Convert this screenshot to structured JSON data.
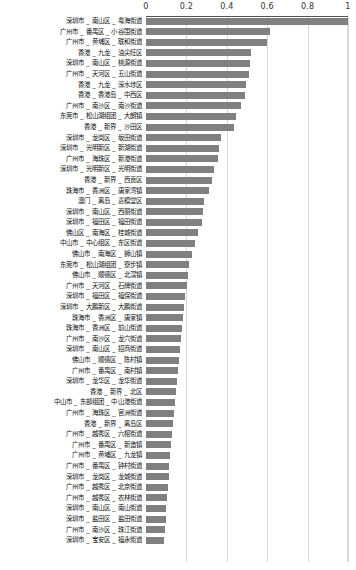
{
  "chart_data": {
    "type": "bar",
    "orientation": "horizontal",
    "title": "",
    "xlabel": "",
    "ylabel": "",
    "xlim": [
      0,
      1
    ],
    "grid": true,
    "legend": null,
    "bar_color": "#808080",
    "axis_color": "#555555",
    "grid_color": "#d8d8d8",
    "xticks": [
      0,
      0.2,
      0.4,
      0.6,
      0.8,
      1
    ],
    "xtick_labels": [
      "0",
      "0.2",
      "0.4",
      "0.6",
      "0.8",
      "1"
    ],
    "categories": [
      "深圳市 _ 南山区 _ 粤海街道",
      "广州市 _ 番禺区 _ 小谷围街道",
      "广州市 _ 黄埔区 _ 联和街道",
      "香港 _ 九龙 _ 油尖旺区",
      "深圳市 _ 南山区 _ 桃源街道",
      "广州市 _ 天河区 _ 五山街道",
      "香港 _ 九龙 _ 深水埗区",
      "香港 _ 香港岛 _ 中西区",
      "广州市 _ 南沙区 _ 南沙街道",
      "东莞市 _ 松山湖组团 _ 大朗镇",
      "香港 _ 新界 _ 沙田区",
      "深圳市 _ 龙岗区 _ 坂田街道",
      "深圳市 _ 光明新区 _ 新湖街道",
      "广州市 _ 海珠区 _ 新港街道",
      "深圳市 _ 光明新区 _ 光明街道",
      "香港 _ 新界 _ 西贡区",
      "珠海市 _ 香洲区 _ 唐家湾镇",
      "澳门 _ 离岛 _ 嘉模堂区",
      "深圳市 _ 南山区 _ 西丽街道",
      "深圳市 _ 福田区 _ 福田街道",
      "佛山区 _ 南海区 _ 桂城街道",
      "中山市 _ 中心组区 _ 东区街道",
      "佛山市 _ 南海区 _ 狮山镇",
      "东莞市 _ 松山湖组团 _ 寮步镇",
      "佛山市 _ 顺德区 _ 北滘镇",
      "广州市 _ 天河区 _ 石牌街道",
      "深圳市 _ 福田区 _ 福保街道",
      "深圳市 _ 大鹏新区 _ 大鹏街道",
      "珠海市 _ 香洲区 _ 唐家镇",
      "珠海市 _ 香洲区 _ 前山街道",
      "广州市 _ 南沙区 _ 龙穴街道",
      "深圳市 _ 南山区 _ 招商街道",
      "佛山市 _ 顺德区 _ 陈村镇",
      "广州市 _ 番禺区 _ 南村镇",
      "深圳市 _ 龙华区 _ 龙华街道",
      "香港 _ 新界 _ 北区",
      "中山市 _ 东部组团 _ 中山港街道",
      "广州市 _ 海珠区 _ 官洲街道",
      "香港 _ 新界 _ 离岛区",
      "广州市 _ 越秀区 _ 六榕街道",
      "广州市 _ 番禺区 _ 新造镇",
      "广州市 _ 黄埔区 _ 九龙镇",
      "广州市 _ 番禺区 _ 钟村街道",
      "深圳市 _ 龙岗区 _ 龙城街道",
      "广州市 _ 越秀区 _ 北京街道",
      "广州市 _ 越秀区 _ 农林街道",
      "深圳市 _ 南山区 _ 南山街道",
      "深圳市 _ 盐田区 _ 盐田街道",
      "广州市 _ 南沙区 _ 珠江街道",
      "深圳市 _ 宝安区 _ 福永街道"
    ],
    "values": [
      1.0,
      0.615,
      0.6,
      0.52,
      0.515,
      0.51,
      0.495,
      0.49,
      0.47,
      0.445,
      0.435,
      0.37,
      0.36,
      0.355,
      0.335,
      0.325,
      0.31,
      0.285,
      0.28,
      0.275,
      0.255,
      0.245,
      0.23,
      0.215,
      0.21,
      0.205,
      0.195,
      0.19,
      0.185,
      0.18,
      0.175,
      0.17,
      0.165,
      0.16,
      0.155,
      0.15,
      0.145,
      0.14,
      0.135,
      0.13,
      0.125,
      0.12,
      0.115,
      0.112,
      0.108,
      0.105,
      0.1,
      0.097,
      0.094,
      0.09
    ]
  }
}
